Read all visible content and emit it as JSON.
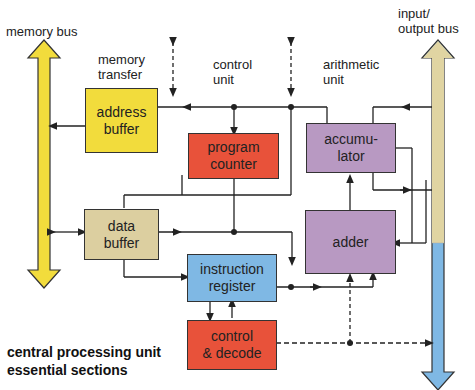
{
  "labels": {
    "memory_bus": "memory bus",
    "memory_transfer": "memory\ntransfer",
    "control_unit": "control\nunit",
    "arithmetic_unit": "arithmetic\nunit",
    "io_bus": "input/\noutput bus"
  },
  "boxes": {
    "address_buffer": "address\nbuffer",
    "program_counter": "program\ncounter",
    "accumulator": "accumu-\nlator",
    "data_buffer": "data\nbuffer",
    "adder": "adder",
    "instruction_register": "instruction\nregister",
    "control_decode": "control\n& decode"
  },
  "title": "central processing unit\nessential sections",
  "colors": {
    "yellow": "#f2dc3c",
    "tan": "#dccfa0",
    "red": "#e8523a",
    "purple": "#b899c2",
    "blue": "#7fb8e4",
    "io_tan": "#e0d4a2"
  }
}
